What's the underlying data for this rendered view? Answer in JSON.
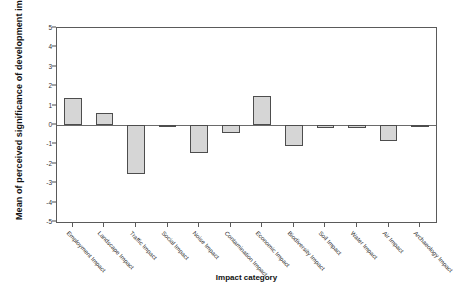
{
  "chart_data": {
    "type": "bar",
    "title": "",
    "xlabel": "Impact category",
    "ylabel": "Mean of perceived significance of development impact",
    "ylim": [
      -5,
      5
    ],
    "yticks": [
      "5",
      "4",
      "3",
      "2",
      "1",
      "0",
      "-1",
      "-2",
      "-3",
      "-4",
      "-5"
    ],
    "ytick_values": [
      5,
      4,
      3,
      2,
      1,
      0,
      -1,
      -2,
      -3,
      -4,
      -5
    ],
    "grid": false,
    "legend": "none",
    "categories": [
      "Employment Impact",
      "Landscape Impact",
      "Traffic Impact",
      "Social Impact",
      "Noise Impact",
      "Contamination Impact",
      "Economic Impact",
      "Biodiversity Impact",
      "Soil Impact",
      "Water Impact",
      "Air Impact",
      "Archaeology Impact"
    ],
    "values": [
      1.4,
      0.6,
      -2.5,
      -0.1,
      -1.45,
      -0.4,
      1.5,
      -1.1,
      -0.15,
      -0.15,
      -0.8,
      -0.1
    ],
    "bar_fill": "#d6d6d6",
    "bar_edge": "#4d4d4d"
  },
  "axis": {
    "x_title": "Impact category",
    "y_title": "Mean of perceived significance of development impact"
  }
}
